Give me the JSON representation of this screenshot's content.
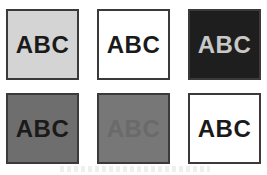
{
  "boxes": [
    {
      "label": "ABC",
      "bg": "#d4d4d4",
      "fg": "#1a1a1a"
    },
    {
      "label": "ABC",
      "bg": "#ffffff",
      "fg": "#1a1a1a"
    },
    {
      "label": "ABC",
      "bg": "#1e1e1e",
      "fg": "#c8c8c8"
    },
    {
      "label": "ABC",
      "bg": "#6e6e6e",
      "fg": "#1a1a1a"
    },
    {
      "label": "ABC",
      "bg": "#777777",
      "fg": "#6a6a6a"
    },
    {
      "label": "ABC",
      "bg": "#ffffff",
      "fg": "#1a1a1a"
    }
  ]
}
